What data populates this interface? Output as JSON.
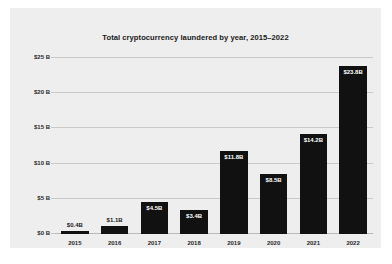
{
  "chart_data": {
    "type": "bar",
    "title": "Total cryptocurrency laundered by year, 2015–2022",
    "xlabel": "",
    "ylabel": "",
    "categories": [
      "2015",
      "2016",
      "2017",
      "2018",
      "2019",
      "2020",
      "2021",
      "2022"
    ],
    "values": [
      0.4,
      1.1,
      4.5,
      3.4,
      11.8,
      8.5,
      14.2,
      23.8
    ],
    "value_labels": [
      "$0.4B",
      "$1.1B",
      "$4.5B",
      "$3.4B",
      "$11.8B",
      "$8.5B",
      "$14.2B",
      "$23.8B"
    ],
    "label_placement": [
      "above",
      "above",
      "inside",
      "inside",
      "inside",
      "inside",
      "inside",
      "inside"
    ],
    "ylim": [
      0,
      25
    ],
    "yticks": [
      0,
      5,
      10,
      15,
      20,
      25
    ],
    "ytick_labels": [
      "$0 B",
      "$5 B",
      "$10 B",
      "$15 B",
      "$20 B",
      "$25 B"
    ],
    "grid": true,
    "legend": false,
    "bar_color": "#111111",
    "panel_color": "#eeeeee",
    "grid_color": "#c9c9c9",
    "text_color": "#1b1b1b"
  }
}
